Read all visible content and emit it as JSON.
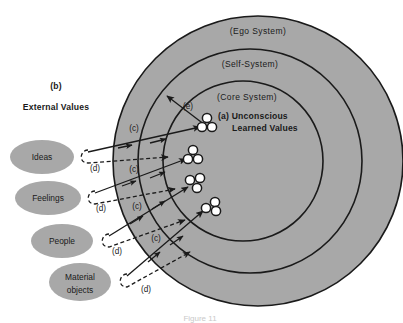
{
  "figure": {
    "type": "concentric-systems-diagram",
    "background_color": "#ffffff",
    "fill_color": "#a8a8a8",
    "stroke_color": "#1a1a1a",
    "node_fill_color": "#ffffff",
    "caption": "Figure 11"
  },
  "systems": [
    {
      "id": "ego",
      "label": "(Ego System)",
      "cx": 258,
      "cy": 161,
      "r": 145
    },
    {
      "id": "self",
      "label": "(Self-System)",
      "cx": 250,
      "cy": 161,
      "r": 112
    },
    {
      "id": "core",
      "label": "(Core System)",
      "cx": 243,
      "cy": 161,
      "r": 80
    }
  ],
  "system_label_positions": [
    {
      "label": "(Ego System)",
      "x": 258,
      "y": 31
    },
    {
      "label": "(Self-System)",
      "x": 250,
      "y": 64
    },
    {
      "label": "(Core System)",
      "x": 243,
      "y": 97
    }
  ],
  "annotations": {
    "b_tag": "(b)",
    "external_values_title": "External Values",
    "a_tag_line1": "(a) Unconscious",
    "a_tag_line2": "Learned Values",
    "e_tag": "(e)",
    "c_tag": "(c)",
    "d_tag": "(d)"
  },
  "external_values": [
    {
      "id": "ideas",
      "label": "Ideas",
      "cx": 42,
      "cy": 157,
      "rx": 32,
      "ry": 17
    },
    {
      "id": "feelings",
      "label": "Feelings",
      "cx": 48,
      "cy": 198,
      "rx": 33,
      "ry": 17
    },
    {
      "id": "people",
      "label": "People",
      "cx": 62,
      "cy": 241,
      "rx": 31,
      "ry": 17
    },
    {
      "id": "material",
      "label_line1": "Material",
      "label_line2": "objects",
      "cx": 80,
      "cy": 282,
      "rx": 31,
      "ry": 19
    }
  ],
  "value_clusters": [
    {
      "id": "cluster-1",
      "cx": 207,
      "cy": 124
    },
    {
      "id": "cluster-2",
      "cx": 194,
      "cy": 156
    },
    {
      "id": "cluster-3",
      "cx": 196,
      "cy": 183
    },
    {
      "id": "cluster-4",
      "cx": 212,
      "cy": 207
    }
  ],
  "c_tag_positions": [
    {
      "x": 134,
      "y": 128
    },
    {
      "x": 134,
      "y": 169
    },
    {
      "x": 136,
      "y": 206
    },
    {
      "x": 155,
      "y": 238
    }
  ],
  "d_tag_positions": [
    {
      "x": 96,
      "y": 168
    },
    {
      "x": 101,
      "y": 207
    },
    {
      "x": 117,
      "y": 250
    },
    {
      "x": 145,
      "y": 288
    }
  ],
  "e_tag_position": {
    "x": 186,
    "y": 106
  },
  "c_arrows": [
    {
      "from_x": 90,
      "from_y": 153,
      "to_x": 200,
      "to_y": 128
    },
    {
      "from_x": 96,
      "from_y": 194,
      "to_x": 188,
      "to_y": 160
    },
    {
      "from_x": 110,
      "from_y": 237,
      "to_x": 190,
      "to_y": 188
    },
    {
      "from_x": 128,
      "from_y": 277,
      "to_x": 205,
      "to_y": 212
    }
  ],
  "d_arrows": [
    {
      "hook_x": 90,
      "hook_y": 155,
      "to_x": 163,
      "to_y": 155
    },
    {
      "hook_x": 96,
      "hook_y": 196,
      "to_x": 170,
      "to_y": 184
    },
    {
      "hook_x": 110,
      "hook_y": 238,
      "to_x": 180,
      "to_y": 216
    },
    {
      "hook_x": 128,
      "hook_y": 278,
      "to_x": 185,
      "to_y": 248
    }
  ]
}
